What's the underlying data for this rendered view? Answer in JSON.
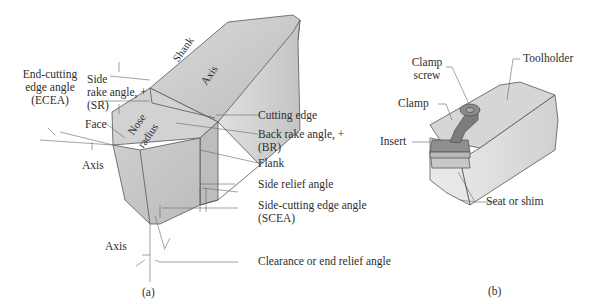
{
  "figure_a": {
    "caption": "(a)",
    "body_labels": {
      "shank": "Shank",
      "axis_top": "Axis",
      "nose": "Nose",
      "radius": "radius"
    },
    "labels": {
      "ecea_1": "End-cutting",
      "ecea_2": "edge angle",
      "ecea_3": "(ECEA)",
      "sr_1": "Side",
      "sr_2": "rake angle, +",
      "sr_3": "(SR)",
      "face": "Face",
      "axis_left": "Axis",
      "axis_bottom": "Axis",
      "cutting_edge": "Cutting edge",
      "br_1": "Back rake angle, +",
      "br_2": "(BR)",
      "flank": "Flank",
      "side_relief": "Side relief angle",
      "scea_1": "Side-cutting edge angle",
      "scea_2": "(SCEA)",
      "clearance": "Clearance or end relief angle"
    }
  },
  "figure_b": {
    "caption": "(b)",
    "labels": {
      "clamp_screw_1": "Clamp",
      "clamp_screw_2": "screw",
      "toolholder": "Toolholder",
      "clamp": "Clamp",
      "insert": "Insert",
      "seat": "Seat or shim"
    }
  },
  "colors": {
    "body_light": "#e4e4e4",
    "body_mid": "#cfcfcf",
    "body_dark": "#b5b5b5",
    "clamp": "#8a8a8a",
    "line": "#555555"
  }
}
